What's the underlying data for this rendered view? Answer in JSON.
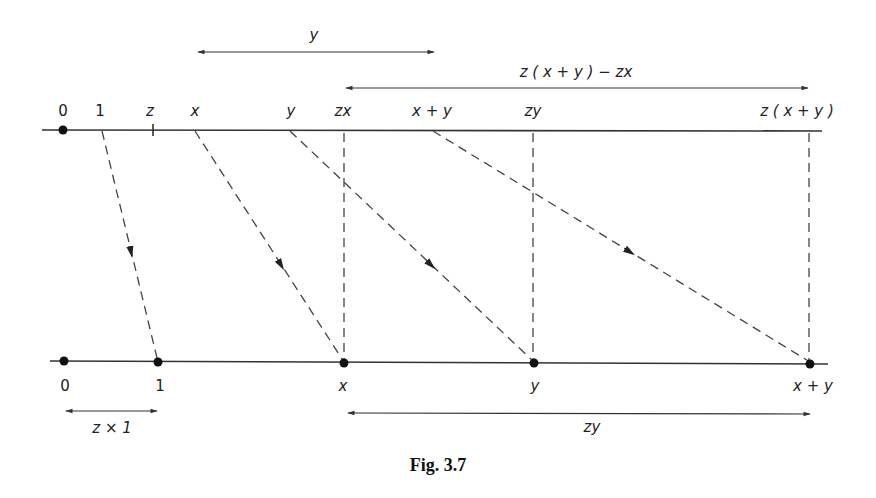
{
  "figure": {
    "caption": "Fig. 3.7"
  },
  "top_line": {
    "labels": {
      "zero": "0",
      "one": "1",
      "z": "z",
      "x": "x",
      "y": "y",
      "zx": "zx",
      "x_plus_y": "x + y",
      "zy": "zy",
      "z_x_plus_y": "z ( x + y )"
    }
  },
  "bottom_line": {
    "labels": {
      "zero": "0",
      "one": "1",
      "x": "x",
      "y": "y",
      "x_plus_y": "x + y"
    }
  },
  "measures": {
    "top_y": "y",
    "top_diff": "z ( x + y ) − zx",
    "bottom_z1": "z × 1",
    "bottom_zy": "zy"
  }
}
